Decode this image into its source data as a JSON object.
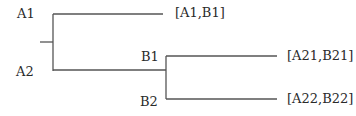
{
  "diagram": {
    "type": "tree",
    "line_color": "#555555",
    "node_labels": {
      "a1": "A1",
      "a2": "A2",
      "b1": "B1",
      "b2": "B2"
    },
    "leaf_labels": {
      "a1_b1": "[A1,B1]",
      "a21_b21": "[A21,B21]",
      "a22_b22": "[A22,B22]"
    }
  }
}
